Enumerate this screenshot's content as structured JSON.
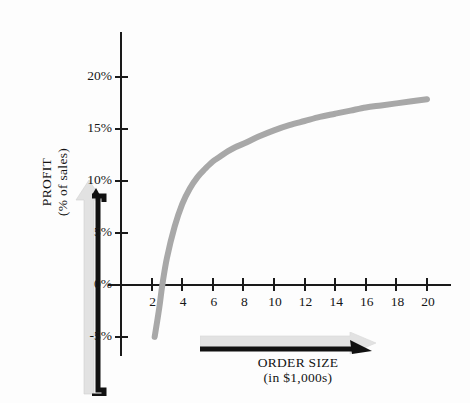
{
  "chart": {
    "type": "line",
    "title": "",
    "background_color": "#fdfdfd",
    "curve_color": "#a8a8a8",
    "axis_color": "#1a1a1a",
    "grid": false,
    "legend": "none",
    "xlabel": "ORDER SIZE",
    "xlabel_sub": "(in $1,000s)",
    "ylabel": "PROFIT",
    "ylabel_sub": "(% of sales)",
    "xlim": [
      0,
      21.5
    ],
    "ylim": [
      -6.5,
      21.5
    ],
    "x_ticks": [
      2,
      4,
      6,
      8,
      10,
      12,
      14,
      16,
      18,
      20
    ],
    "x_tick_labels": [
      "2",
      "4",
      "6",
      "8",
      "10",
      "12",
      "14",
      "16",
      "18",
      "20"
    ],
    "y_ticks": [
      20,
      15,
      10,
      5,
      0,
      -5
    ],
    "y_tick_labels": [
      "20%",
      "15%",
      "10%",
      "5%",
      "0%",
      "-5%"
    ],
    "zero_crossing_x": 2.7,
    "x": [
      2.2,
      2.5,
      2.7,
      3,
      3.5,
      4,
      4.5,
      5,
      5.5,
      6,
      6.5,
      7,
      7.5,
      8,
      9,
      10,
      11,
      12,
      13,
      14,
      15,
      16,
      17,
      18,
      19,
      20
    ],
    "values": [
      -5.0,
      -2.2,
      0.0,
      2.6,
      5.6,
      7.8,
      9.3,
      10.4,
      11.2,
      11.9,
      12.4,
      12.9,
      13.3,
      13.6,
      14.3,
      14.9,
      15.4,
      15.8,
      16.2,
      16.5,
      16.8,
      17.1,
      17.3,
      17.5,
      17.7,
      17.9
    ],
    "annotations": []
  },
  "axis_titles": {
    "y_line1": "PROFIT",
    "y_line2": "(% of sales)",
    "x_line1": "ORDER SIZE",
    "x_line2": "(in $1,000s)"
  }
}
